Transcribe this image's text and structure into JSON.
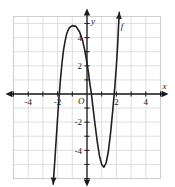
{
  "figure": {
    "kind": "coordinate-graph",
    "function_label": "f",
    "x_axis_label": "x",
    "y_axis_label": "y",
    "origin_label": "O"
  },
  "axis": {
    "x_ticks_labeled": [
      "-4",
      "-2",
      "2",
      "4"
    ],
    "y_ticks_labeled": [
      "4",
      "2",
      "-2",
      "-4"
    ]
  },
  "chart_data": {
    "type": "line",
    "title": "",
    "xlabel": "x",
    "ylabel": "y",
    "xlim": [
      -5,
      5
    ],
    "ylim": [
      -6,
      5.5
    ],
    "grid": true,
    "legend": "none",
    "x_ticks": [
      -4,
      -2,
      2,
      4
    ],
    "y_ticks": [
      4,
      2,
      -2,
      -4
    ],
    "x_tick_labels": [
      "-4",
      "-2",
      "2",
      "4"
    ],
    "y_tick_labels": [
      "4",
      "2",
      "-2",
      "-4"
    ],
    "annotations": [
      {
        "text": "f",
        "x": 2.3,
        "y": 4.6
      },
      {
        "text": "O",
        "x": -0.35,
        "y": -0.55
      }
    ],
    "series": [
      {
        "name": "f",
        "type": "cubic",
        "roots": [
          -2.0,
          0.3,
          1.9
        ],
        "local_maximum": {
          "x": -0.75,
          "y": 4.8
        },
        "local_minimum": {
          "x": 1.15,
          "y": -5.2
        },
        "y_intercept": 1.1,
        "end_behavior": {
          "left": "down",
          "right": "up"
        },
        "arrow_start": {
          "x": -2.25,
          "y": -6.0
        },
        "arrow_end": {
          "x": 2.15,
          "y": 5.4
        },
        "points": [
          {
            "x": -2.3,
            "y": -6.4
          },
          {
            "x": -2.2,
            "y": -4.9
          },
          {
            "x": -2.1,
            "y": -3.3
          },
          {
            "x": -2.0,
            "y": -1.7
          },
          {
            "x": -1.9,
            "y": -0.2
          },
          {
            "x": -1.8,
            "y": 1.1
          },
          {
            "x": -1.7,
            "y": 2.2
          },
          {
            "x": -1.6,
            "y": 3.1
          },
          {
            "x": -1.5,
            "y": 3.7
          },
          {
            "x": -1.4,
            "y": 4.2
          },
          {
            "x": -1.3,
            "y": 4.5
          },
          {
            "x": -1.2,
            "y": 4.7
          },
          {
            "x": -1.0,
            "y": 4.85
          },
          {
            "x": -0.75,
            "y": 4.8
          },
          {
            "x": -0.5,
            "y": 4.4
          },
          {
            "x": -0.3,
            "y": 3.8
          },
          {
            "x": -0.15,
            "y": 3.1
          },
          {
            "x": 0.0,
            "y": 2.2
          },
          {
            "x": 0.1,
            "y": 1.5
          },
          {
            "x": 0.2,
            "y": 0.7
          },
          {
            "x": 0.3,
            "y": 0.0
          },
          {
            "x": 0.4,
            "y": -0.9
          },
          {
            "x": 0.55,
            "y": -2.2
          },
          {
            "x": 0.7,
            "y": -3.4
          },
          {
            "x": 0.85,
            "y": -4.4
          },
          {
            "x": 1.0,
            "y": -5.0
          },
          {
            "x": 1.15,
            "y": -5.2
          },
          {
            "x": 1.3,
            "y": -4.9
          },
          {
            "x": 1.45,
            "y": -4.1
          },
          {
            "x": 1.6,
            "y": -2.8
          },
          {
            "x": 1.75,
            "y": -1.2
          },
          {
            "x": 1.9,
            "y": 0.6
          },
          {
            "x": 2.0,
            "y": 2.0
          },
          {
            "x": 2.08,
            "y": 3.4
          },
          {
            "x": 2.15,
            "y": 4.9
          },
          {
            "x": 2.2,
            "y": 5.8
          }
        ]
      }
    ]
  }
}
